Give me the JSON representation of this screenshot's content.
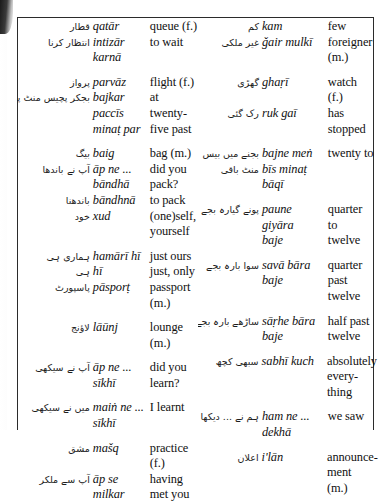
{
  "page": {
    "type": "bilingual-glossary",
    "layout": "two-column",
    "columns": [
      {
        "name": "left-column",
        "entries": [
          {
            "script": "قطار",
            "translit": "qatār",
            "english": "queue (f.)"
          },
          {
            "script": "انتظار کرنا",
            "translit": "intizār\nkarnā",
            "english": "to wait"
          },
          {
            "script": "پرواز",
            "translit": "parvāz",
            "english": "flight (f.)",
            "gap_before": true
          },
          {
            "script": "بجکر پچیس منٹ پر",
            "translit": "bajkar\npaccīs\nminaṭ par",
            "english": "at twenty-\nfive past"
          },
          {
            "script": "بیگ",
            "translit": "baig",
            "english": "bag (m.)",
            "gap_before": true
          },
          {
            "script": "آپ نے باندھا",
            "translit": "āp ne ...\nbāndhā",
            "english": "did you\npack?"
          },
          {
            "script": "باندھنا",
            "translit": "bāndhnā",
            "english": "to pack"
          },
          {
            "script": "خود",
            "translit": "xud",
            "english": "(one)self,\nyourself"
          },
          {
            "script": "ہماری ہی",
            "translit": "hamārī hī",
            "english": "just ours",
            "gap_before": true
          },
          {
            "script": "ہی",
            "translit": "hī",
            "english": "just, only"
          },
          {
            "script": "پاسپورٹ",
            "translit": "pāsporṭ",
            "english": "passport\n(m.)"
          },
          {
            "script": "لاؤنج",
            "translit": "lāūnj",
            "english": "lounge\n(m.)",
            "gap_before": true
          },
          {
            "script": "آپ نے سیکھی",
            "translit": "āp ne ...\nsīkhī",
            "english": "did you\nlearn?",
            "gap_before": true
          },
          {
            "script": "میں نے سیکھی",
            "translit": "maiṅ ne ...\nsīkhī",
            "english": "I learnt",
            "gap_before": true
          },
          {
            "script": "مشق",
            "translit": "mašq",
            "english": "practice (f.)",
            "gap_before": true
          },
          {
            "script": "آپ سے ملکر",
            "translit": "āp se\nmilkar",
            "english": "having\nmet you"
          }
        ]
      },
      {
        "name": "right-column",
        "entries": [
          {
            "script": "کم",
            "translit": "kam",
            "english": "few"
          },
          {
            "script": "غیر ملکی",
            "translit": "ǧair mulkī",
            "english": "foreigner\n(m.)"
          },
          {
            "script": "گھڑی",
            "translit": "ghaṛī",
            "english": "watch (f.)",
            "gap_before": true
          },
          {
            "script": "رک گئی",
            "translit": "ruk gaī",
            "english": "has\nstopped"
          },
          {
            "script": "بجنے میں بیس",
            "translit": "bajne meṅ",
            "english": "twenty to",
            "gap_before": true
          },
          {
            "script": "منٹ باقی",
            "translit": "bīs minaṭ\nbāqī",
            "english": ""
          },
          {
            "script": "پونے گیارہ بجے",
            "translit": "paune\ngiyāra\nbaje",
            "english": "quarter to\ntwelve",
            "gap_before": true
          },
          {
            "script": "سوا بارہ بجے",
            "translit": "savā bāra\nbaje",
            "english": "quarter\npast\ntwelve",
            "gap_before": true
          },
          {
            "script": "ساڑھے بارہ بجے",
            "translit": "sāṛhe bāra\nbaje",
            "english": "half past\ntwelve",
            "gap_before": true
          },
          {
            "script": "سبھی کچھ",
            "translit": "sabhī kuch",
            "english": "absolutely\nevery-\nthing",
            "gap_before": true
          },
          {
            "script": "ہم نے ... دیکھا",
            "translit": "ham ne ...\ndekhā",
            "english": "we saw",
            "gap_before": true
          },
          {
            "script": "اعلان",
            "translit": "i'lān",
            "english": "announce-\nment (m.)",
            "gap_before": true
          }
        ]
      }
    ]
  }
}
